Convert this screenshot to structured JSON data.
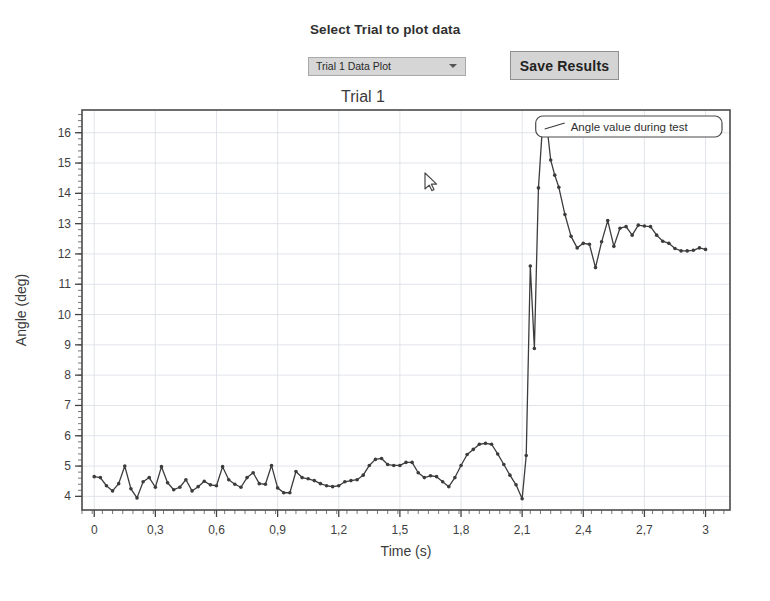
{
  "controls": {
    "select_trial_label": "Select Trial to plot data",
    "trial_dropdown_value": "Trial 1 Data Plot",
    "trial_dropdown_options": [
      "Trial 1 Data Plot"
    ],
    "save_button_label": "Save Results",
    "chevron_icon": "chevron-down-icon",
    "cursor_icon": "cursor-pointer-icon"
  },
  "chart_data": {
    "type": "line",
    "title": "Trial 1",
    "xlabel": "Time (s)",
    "ylabel": "Angle (deg)",
    "xlim": [
      -0.06,
      3.12
    ],
    "ylim": [
      3.55,
      16.75
    ],
    "xticks": [
      0,
      0.3,
      0.6,
      0.9,
      1.2,
      1.5,
      1.8,
      2.1,
      2.4,
      2.7,
      3
    ],
    "xtick_labels": [
      "0",
      "0,3",
      "0,6",
      "0,9",
      "1,2",
      "1,5",
      "1,8",
      "2,1",
      "2,4",
      "2,7",
      "3"
    ],
    "yticks": [
      4,
      5,
      6,
      7,
      8,
      9,
      10,
      11,
      12,
      13,
      14,
      15,
      16
    ],
    "ytick_labels": [
      "4",
      "5",
      "6",
      "7",
      "8",
      "9",
      "10",
      "11",
      "12",
      "13",
      "14",
      "15",
      "16"
    ],
    "grid": true,
    "minor_ticks": true,
    "legend_position": "top-right",
    "line_color": "#3c3c3c",
    "marker": "circle",
    "series": [
      {
        "name": "Angle value during test",
        "x": [
          0.0,
          0.03,
          0.06,
          0.09,
          0.12,
          0.15,
          0.18,
          0.21,
          0.24,
          0.27,
          0.3,
          0.33,
          0.36,
          0.39,
          0.42,
          0.45,
          0.48,
          0.51,
          0.54,
          0.57,
          0.6,
          0.63,
          0.66,
          0.69,
          0.72,
          0.75,
          0.78,
          0.81,
          0.84,
          0.87,
          0.9,
          0.93,
          0.96,
          0.99,
          1.02,
          1.05,
          1.08,
          1.11,
          1.14,
          1.17,
          1.2,
          1.23,
          1.26,
          1.29,
          1.32,
          1.35,
          1.38,
          1.41,
          1.44,
          1.47,
          1.5,
          1.53,
          1.56,
          1.59,
          1.62,
          1.65,
          1.68,
          1.71,
          1.74,
          1.77,
          1.8,
          1.83,
          1.86,
          1.89,
          1.92,
          1.95,
          1.98,
          2.01,
          2.04,
          2.07,
          2.1,
          2.12,
          2.14,
          2.16,
          2.18,
          2.2,
          2.22,
          2.24,
          2.26,
          2.28,
          2.31,
          2.34,
          2.37,
          2.4,
          2.43,
          2.46,
          2.49,
          2.52,
          2.55,
          2.58,
          2.61,
          2.64,
          2.67,
          2.7,
          2.73,
          2.76,
          2.79,
          2.82,
          2.85,
          2.88,
          2.91,
          2.94,
          2.97,
          3.0
        ],
        "y": [
          4.65,
          4.62,
          4.35,
          4.18,
          4.42,
          5.0,
          4.25,
          3.95,
          4.48,
          4.62,
          4.3,
          4.98,
          4.45,
          4.22,
          4.3,
          4.55,
          4.18,
          4.32,
          4.5,
          4.38,
          4.35,
          4.98,
          4.55,
          4.4,
          4.3,
          4.62,
          4.78,
          4.42,
          4.4,
          5.02,
          4.28,
          4.12,
          4.12,
          4.82,
          4.62,
          4.58,
          4.52,
          4.42,
          4.35,
          4.32,
          4.35,
          4.48,
          4.52,
          4.55,
          4.7,
          5.02,
          5.22,
          5.25,
          5.05,
          5.02,
          5.02,
          5.12,
          5.12,
          4.78,
          4.62,
          4.68,
          4.65,
          4.48,
          4.32,
          4.62,
          5.02,
          5.38,
          5.55,
          5.72,
          5.75,
          5.72,
          5.4,
          5.05,
          4.7,
          4.38,
          3.92,
          5.35,
          11.6,
          8.88,
          14.18,
          16.25,
          16.32,
          15.1,
          14.6,
          14.2,
          13.3,
          12.58,
          12.2,
          12.35,
          12.32,
          11.55,
          12.4,
          13.1,
          12.25,
          12.85,
          12.9,
          12.62,
          12.95,
          12.92,
          12.9,
          12.62,
          12.42,
          12.35,
          12.18,
          12.1,
          12.1,
          12.12,
          12.2,
          12.15
        ]
      }
    ]
  }
}
